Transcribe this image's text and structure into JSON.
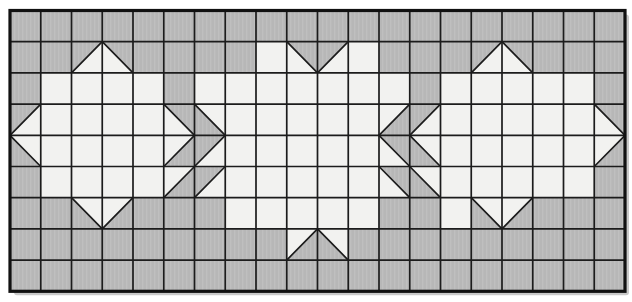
{
  "figure": {
    "canvas": {
      "width": 632,
      "height": 302,
      "background": "#ffffff"
    },
    "grid": {
      "cols": 20,
      "rows": 9,
      "origin_x": 10,
      "origin_y": 10.5,
      "cell_w": 30.75,
      "cell_h": 31.2,
      "colors": {
        "gray_fill": "#b7b7b7",
        "gray_stripe": "#bfbfbf",
        "white_fill": "#f2f2f0",
        "line": "#1c1c1c",
        "border": "#111111",
        "shadow": "#c9c9c9"
      },
      "line_width": 1.7,
      "border_width": 3.2,
      "shadow_offset": 4,
      "legend": {
        "G": "solid gray square",
        "W": "solid white square",
        "A": "diagonal TL-BR, gray upper-right, white lower-left",
        "B": "diagonal TL-BR, gray lower-left, white upper-right",
        "C": "diagonal BL-TR, gray upper-left, white lower-right",
        "D": "diagonal BL-TR, gray lower-right, white upper-left"
      },
      "row_codes": [
        "GGGGGGGGGGGGGGGGGGGG",
        "GGCAGGGGWACWGGGCAGGG",
        "GWWWWGWWWWWWWGWWWWWG",
        "CWWWWABWWWWWDCWWWWWA",
        "BWWWWDCWWWWWABWWWWWD",
        "GWWWWDCWWWWWABWWWWWG",
        "GGBDGGGWWWWWGGWBDGGG",
        "GGGGGGGGGDBGGGGGGGGG",
        "GGGGGGGGGGGGGGGGGGGG"
      ]
    }
  }
}
